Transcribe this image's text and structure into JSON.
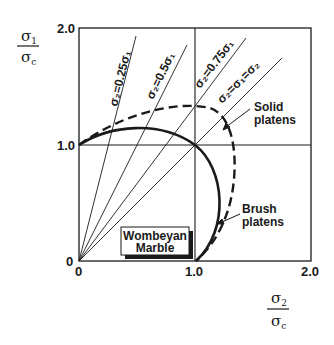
{
  "diagram": {
    "y_axis_label": {
      "numerator": "σ",
      "numerator_sub": "1",
      "denominator": "σ",
      "denominator_sub": "c"
    },
    "x_axis_label": {
      "numerator": "σ",
      "numerator_sub": "2",
      "denominator": "σ",
      "denominator_sub": "c"
    },
    "y_ticks": [
      "2.0",
      "1.0",
      "0"
    ],
    "x_ticks": [
      "0",
      "1.0",
      "2.0"
    ],
    "stress_path_lines": [
      {
        "label": "σ₂=0.25σ₁",
        "ratio": 0.25
      },
      {
        "label": "σ₂=0.5σ₁",
        "ratio": 0.5
      },
      {
        "label": "σ₂=0.75σ₁",
        "ratio": 0.75
      },
      {
        "label": "σ₂=σ₁=σ₂",
        "ratio": 1.0
      }
    ],
    "curves": [
      {
        "name": "Solid platens",
        "style": "dashed"
      },
      {
        "name": "Brush platens",
        "style": "solid"
      }
    ],
    "annotations": {
      "solid_line1": "Solid",
      "solid_line2": "platens",
      "brush_line1": "Brush",
      "brush_line2": "platens"
    },
    "material_box": {
      "line1": "Wombeyan",
      "line2": "Marble"
    }
  }
}
